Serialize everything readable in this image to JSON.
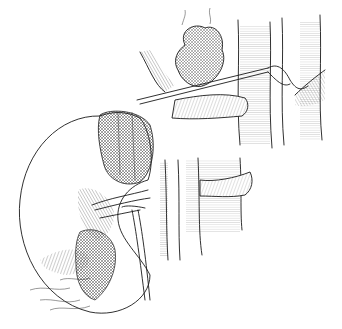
{
  "figure": {
    "type": "anatomical-line-illustration",
    "style": "black ink hatched engraving on white",
    "background": "#ffffff",
    "ink": "#1a1a1a",
    "subjects": [
      "kidney",
      "adrenal-gland",
      "renal-vessels",
      "ureter",
      "aorta",
      "inferior-vena-cava",
      "surgical-instrument"
    ]
  }
}
